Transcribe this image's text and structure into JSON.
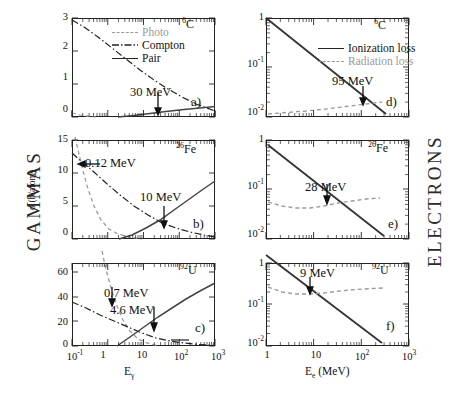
{
  "figure": {
    "left_side_label": "GAMMAS",
    "right_side_label": "ELECTRONS"
  },
  "axes": {
    "gamma_x_title": "E",
    "gamma_x_title_sub": "γ",
    "electron_x_title": "E",
    "electron_x_title_sub": "e",
    "electron_x_title_unit": "(MeV)",
    "gamma_y_title": "σ (b/atom)",
    "gamma_x_ticks": [
      "10⁻¹",
      "1",
      "10",
      "10²",
      "10³"
    ],
    "electron_x_ticks": [
      "1",
      "10",
      "10²",
      "10³"
    ],
    "electron_y_ticks": [
      "1",
      "10⁻¹",
      "10⁻²"
    ]
  },
  "legends": {
    "gamma": [
      {
        "label": "Photo",
        "style": "dashed",
        "color": "#9a9a9a"
      },
      {
        "label": "Compton",
        "style": "dashdot",
        "color": "#222222"
      },
      {
        "label": "Pair",
        "style": "solid",
        "color": "#222222"
      }
    ],
    "electron": [
      {
        "label": "Ionization loss",
        "style": "solid",
        "color": "#222222"
      },
      {
        "label": "Radiation loss",
        "style": "dashed",
        "color": "#9a9a9a"
      }
    ]
  },
  "panels": [
    {
      "id": "a",
      "index_label": "a)",
      "element_z": "6",
      "element_symbol": "C",
      "column": "gamma",
      "y_ticks": [
        "0",
        "1",
        "2",
        "3"
      ],
      "annotations": [
        {
          "text": "30 MeV",
          "energy_mev": 30
        }
      ]
    },
    {
      "id": "b",
      "index_label": "b)",
      "element_z": "26",
      "element_symbol": "Fe",
      "column": "gamma",
      "y_ticks": [
        "0",
        "5",
        "10",
        "15"
      ],
      "annotations": [
        {
          "text": "0.12 MeV",
          "energy_mev": 0.12
        },
        {
          "text": "10 MeV",
          "energy_mev": 10
        }
      ]
    },
    {
      "id": "c",
      "index_label": "c)",
      "element_z": "92",
      "element_symbol": "U",
      "column": "gamma",
      "y_ticks": [
        "0",
        "20",
        "40",
        "60"
      ],
      "annotations": [
        {
          "text": "0.7 MeV",
          "energy_mev": 0.7
        },
        {
          "text": "4.6 MeV",
          "energy_mev": 4.6
        }
      ]
    },
    {
      "id": "d",
      "index_label": "d)",
      "element_z": "6",
      "element_symbol": "C",
      "column": "electron",
      "y_ticks": [
        "1",
        "10⁻¹",
        "10⁻²"
      ],
      "annotations": [
        {
          "text": "95 MeV",
          "energy_mev": 95
        }
      ]
    },
    {
      "id": "e",
      "index_label": "e)",
      "element_z": "26",
      "element_symbol": "Fe",
      "column": "electron",
      "y_ticks": [
        "1",
        "10⁻¹",
        "10⁻²"
      ],
      "annotations": [
        {
          "text": "28 MeV",
          "energy_mev": 28
        }
      ]
    },
    {
      "id": "f",
      "index_label": "f)",
      "element_z": "92",
      "element_symbol": "U",
      "column": "electron",
      "y_ticks": [
        "1",
        "10⁻¹",
        "10⁻²"
      ],
      "annotations": [
        {
          "text": "9 MeV",
          "energy_mev": 9
        }
      ]
    }
  ],
  "chart_data": [
    {
      "type": "line",
      "panel": "a",
      "title": "6C photon cross sections",
      "xlabel": "Eγ (MeV)",
      "ylabel": "σ (b/atom)",
      "xscale": "log",
      "yscale": "linear",
      "xlim": [
        0.1,
        1000
      ],
      "ylim": [
        0,
        3.2
      ],
      "crossover_mev": 30,
      "series": [
        {
          "name": "Photo",
          "style": "dashed",
          "x": [
            0.1,
            0.15,
            0.2,
            0.3,
            0.5,
            0.8,
            1.0,
            2.0
          ],
          "y": [
            0.12,
            0.04,
            0.015,
            0.005,
            0.001,
            0.0005,
            0.0002,
            0.0
          ]
        },
        {
          "name": "Compton",
          "style": "dashdot",
          "x": [
            0.1,
            0.2,
            0.4,
            0.7,
            1.0,
            2.0,
            4.0,
            7.0,
            10.0,
            20.0,
            30.0,
            60.0,
            100.0,
            300.0,
            1000.0
          ],
          "y": [
            2.95,
            2.55,
            2.05,
            1.72,
            1.5,
            1.05,
            0.68,
            0.46,
            0.35,
            0.2,
            0.15,
            0.09,
            0.06,
            0.03,
            0.01
          ]
        },
        {
          "name": "Pair",
          "style": "solid",
          "x": [
            1.02,
            2.0,
            4.0,
            7.0,
            10.0,
            20.0,
            30.0,
            60.0,
            100.0,
            300.0,
            1000.0
          ],
          "y": [
            0.0,
            0.01,
            0.03,
            0.06,
            0.08,
            0.13,
            0.16,
            0.2,
            0.23,
            0.27,
            0.3
          ]
        }
      ]
    },
    {
      "type": "line",
      "panel": "b",
      "title": "26Fe photon cross sections",
      "xlabel": "Eγ (MeV)",
      "ylabel": "σ (b/atom)",
      "xscale": "log",
      "yscale": "linear",
      "xlim": [
        0.1,
        1000
      ],
      "ylim": [
        0,
        16
      ],
      "crossover_mev": [
        0.12,
        10
      ],
      "series": [
        {
          "name": "Photo",
          "style": "dashed",
          "x": [
            0.1,
            0.12,
            0.15,
            0.2,
            0.3,
            0.5,
            0.8,
            1.2,
            2.0,
            3.0
          ],
          "y": [
            16.0,
            11.8,
            7.2,
            3.2,
            1.1,
            0.35,
            0.12,
            0.05,
            0.02,
            0.0
          ]
        },
        {
          "name": "Compton",
          "style": "dashdot",
          "x": [
            0.1,
            0.12,
            0.2,
            0.4,
            0.7,
            1.0,
            2.0,
            4.0,
            7.0,
            10.0,
            20.0,
            40.0,
            100.0,
            300.0
          ],
          "y": [
            13.2,
            11.8,
            10.6,
            8.6,
            7.2,
            6.3,
            4.4,
            2.8,
            1.9,
            1.5,
            0.85,
            0.5,
            0.25,
            0.1
          ]
        },
        {
          "name": "Pair",
          "style": "solid",
          "x": [
            1.02,
            2.0,
            4.0,
            7.0,
            10.0,
            20.0,
            40.0,
            100.0,
            300.0,
            1000.0
          ],
          "y": [
            0.0,
            0.15,
            0.5,
            1.0,
            1.5,
            2.5,
            3.4,
            4.2,
            4.7,
            5.0
          ]
        }
      ]
    },
    {
      "type": "line",
      "panel": "c",
      "title": "92U photon cross sections",
      "xlabel": "Eγ (MeV)",
      "ylabel": "σ (b/atom)",
      "xscale": "log",
      "yscale": "linear",
      "xlim": [
        0.1,
        1000
      ],
      "ylim": [
        0,
        75
      ],
      "crossover_mev": [
        0.7,
        4.6
      ],
      "series": [
        {
          "name": "Photo",
          "style": "dashed",
          "x": [
            0.3,
            0.4,
            0.5,
            0.7,
            1.0,
            1.5,
            2.0,
            3.0
          ],
          "y": [
            75.0,
            62.0,
            50.0,
            27.0,
            13.0,
            5.0,
            2.0,
            0.3
          ]
        },
        {
          "name": "Compton",
          "style": "dashdot",
          "x": [
            0.1,
            0.3,
            0.7,
            1.0,
            2.0,
            4.6,
            7.0,
            10.0,
            20.0,
            40.0
          ],
          "y": [
            39.0,
            33.0,
            27.0,
            23.0,
            15.0,
            8.0,
            6.0,
            4.5,
            2.6,
            1.4
          ]
        },
        {
          "name": "Pair",
          "style": "solid",
          "x": [
            1.02,
            2.0,
            4.6,
            7.0,
            10.0,
            20.0,
            40.0,
            100.0,
            300.0,
            1000.0
          ],
          "y": [
            0.0,
            1.5,
            8.0,
            12.0,
            16.0,
            23.0,
            29.0,
            34.0,
            37.0,
            39.0
          ]
        }
      ]
    },
    {
      "type": "line",
      "panel": "d",
      "title": "6C electron energy loss",
      "xlabel": "Ee (MeV)",
      "ylabel": "",
      "xscale": "log",
      "yscale": "log",
      "xlim": [
        1,
        1000
      ],
      "ylim": [
        0.01,
        1
      ],
      "crossover_mev": 95,
      "series": [
        {
          "name": "Ionization loss",
          "style": "solid",
          "x": [
            1,
            3,
            10,
            30,
            95,
            200,
            400
          ],
          "y": [
            1.0,
            0.33,
            0.1,
            0.033,
            0.0105,
            0.005,
            0.0025
          ]
        },
        {
          "name": "Radiation loss",
          "style": "dashed",
          "x": [
            1,
            3,
            10,
            30,
            95,
            200,
            400
          ],
          "y": [
            0.0092,
            0.0095,
            0.0098,
            0.0102,
            0.0105,
            0.0112,
            0.012
          ]
        }
      ]
    },
    {
      "type": "line",
      "panel": "e",
      "title": "26Fe electron energy loss",
      "xlabel": "Ee (MeV)",
      "ylabel": "",
      "xscale": "log",
      "yscale": "log",
      "xlim": [
        1,
        1000
      ],
      "ylim": [
        0.01,
        1
      ],
      "crossover_mev": 28,
      "series": [
        {
          "name": "Ionization loss",
          "style": "solid",
          "x": [
            1,
            3,
            10,
            28,
            100,
            300
          ],
          "y": [
            0.78,
            0.26,
            0.08,
            0.05,
            0.02,
            0.0085
          ]
        },
        {
          "name": "Radiation loss",
          "style": "dashed",
          "x": [
            1,
            2,
            4,
            8,
            28,
            60,
            150,
            300
          ],
          "y": [
            0.053,
            0.046,
            0.042,
            0.043,
            0.05,
            0.056,
            0.062,
            0.065
          ]
        }
      ]
    },
    {
      "type": "line",
      "panel": "f",
      "title": "92U electron energy loss",
      "xlabel": "Ee (MeV)",
      "ylabel": "",
      "xscale": "log",
      "yscale": "log",
      "xlim": [
        1,
        1000
      ],
      "ylim": [
        0.01,
        1
      ],
      "crossover_mev": 9,
      "series": [
        {
          "name": "Ionization loss",
          "style": "solid",
          "x": [
            1,
            3,
            9,
            30,
            100
          ],
          "y": [
            1.0,
            0.35,
            0.135,
            0.04,
            0.012
          ]
        },
        {
          "name": "Radiation loss",
          "style": "dashed",
          "x": [
            1,
            2,
            4,
            9,
            20,
            60,
            150,
            300
          ],
          "y": [
            0.175,
            0.148,
            0.133,
            0.135,
            0.145,
            0.16,
            0.172,
            0.178
          ]
        }
      ]
    }
  ]
}
